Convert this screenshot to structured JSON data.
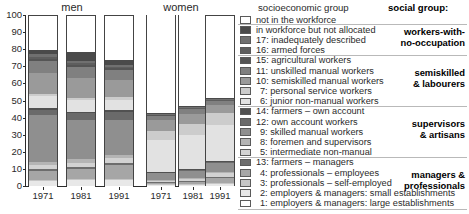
{
  "chart_data": {
    "type": "bar",
    "subtype": "stacked-100-percent",
    "title": "",
    "xlabel": "",
    "ylabel": "",
    "ylim": [
      0,
      100
    ],
    "yticks": [
      0,
      10,
      20,
      30,
      40,
      50,
      60,
      70,
      80,
      90,
      100
    ],
    "grid": false,
    "legend_position": "right",
    "panels": [
      {
        "label": "men",
        "categories": [
          "1971",
          "1981",
          "1991"
        ]
      },
      {
        "label": "women",
        "categories": [
          "1971",
          "1981",
          "1991"
        ]
      }
    ],
    "series": [
      {
        "name": "1: employers & managers: large establishments",
        "code": "1",
        "color": "#ffffff",
        "values": {
          "men": [
            0.8,
            0.8,
            0.8
          ],
          "women": [
            0.3,
            0.3,
            0.4
          ]
        }
      },
      {
        "name": "2: employers & managers: small establishments",
        "code": "2",
        "color": "#e8e8e8",
        "values": {
          "men": [
            2.9,
            3.4,
            3.4
          ],
          "women": [
            1.0,
            1.2,
            1.6
          ]
        }
      },
      {
        "name": "3: professionals – self-employed",
        "code": "3",
        "color": "#c6c6c6",
        "values": {
          "men": [
            0.6,
            0.6,
            0.6
          ],
          "women": [
            0.2,
            0.2,
            0.3
          ]
        }
      },
      {
        "name": "4: professionals – employees",
        "code": "4",
        "color": "#a6a6a6",
        "values": {
          "men": [
            5.2,
            5.7,
            8.2
          ],
          "women": [
            1.0,
            1.4,
            3.4
          ]
        }
      },
      {
        "name": "13: farmers – managers",
        "code": "13",
        "color": "#6d6d6d",
        "values": {
          "men": [
            1.1,
            1.0,
            0.9
          ],
          "women": [
            0.2,
            0.2,
            0.2
          ]
        }
      },
      {
        "name": "5: intermediate non-manual",
        "code": "5",
        "color": "#d2d2d2",
        "values": {
          "men": [
            2.2,
            2.5,
            2.9
          ],
          "women": [
            1.1,
            1.3,
            2.1
          ]
        }
      },
      {
        "name": "8: foremen and supervisors",
        "code": "8",
        "color": "#b4b4b4",
        "values": {
          "men": [
            2.1,
            2.2,
            2.1
          ],
          "women": [
            0.4,
            0.5,
            0.6
          ]
        }
      },
      {
        "name": "9: skilled manual workers",
        "code": "9",
        "color": "#8f8f8f",
        "values": {
          "men": [
            27.0,
            23.0,
            20.0
          ],
          "women": [
            3.7,
            4.3,
            5.2
          ]
        }
      },
      {
        "name": "12: own account workers",
        "code": "12",
        "color": "#6a6a6a",
        "values": {
          "men": [
            3.2,
            3.8,
            5.0
          ],
          "women": [
            0.8,
            0.9,
            1.4
          ]
        }
      },
      {
        "name": "14: farmers – own account",
        "code": "14",
        "color": "#515151",
        "values": {
          "men": [
            1.2,
            1.1,
            0.9
          ],
          "women": [
            0.2,
            0.2,
            0.2
          ]
        }
      },
      {
        "name": "6: junior non-manual workers",
        "code": "6",
        "color": "#e2e2e2",
        "values": {
          "men": [
            6.8,
            6.5,
            6.3
          ],
          "women": [
            18.5,
            20.0,
            21.0
          ]
        }
      },
      {
        "name": "7: personal service workers",
        "code": "7",
        "color": "#cccccc",
        "values": {
          "men": [
            1.3,
            1.4,
            1.7
          ],
          "women": [
            5.5,
            6.2,
            6.8
          ]
        }
      },
      {
        "name": "10: semiskilled manual workers",
        "code": "10",
        "color": "#9a9a9a",
        "values": {
          "men": [
            12.0,
            11.5,
            10.0
          ],
          "women": [
            6.0,
            5.8,
            4.6
          ]
        }
      },
      {
        "name": "11: unskilled manual workers",
        "code": "11",
        "color": "#808080",
        "values": {
          "men": [
            7.0,
            6.5,
            5.5
          ],
          "women": [
            3.0,
            3.1,
            2.6
          ]
        }
      },
      {
        "name": "15: agricultural workers",
        "code": "15",
        "color": "#555555",
        "values": {
          "men": [
            1.6,
            1.3,
            1.1
          ],
          "women": [
            0.4,
            0.4,
            0.3
          ]
        }
      },
      {
        "name": "16: armed forces",
        "code": "16",
        "color": "#5e5e5e",
        "values": {
          "men": [
            1.3,
            1.2,
            1.0
          ],
          "women": [
            0.1,
            0.1,
            0.1
          ]
        }
      },
      {
        "name": "17: inadequately described",
        "code": "17",
        "color": "#707070",
        "values": {
          "men": [
            1.4,
            1.3,
            1.2
          ],
          "women": [
            0.5,
            0.5,
            0.5
          ]
        }
      },
      {
        "name": "in workforce but not allocated",
        "code": "na",
        "color": "#4a4a4a",
        "values": {
          "men": [
            2.3,
            5.2,
            2.4
          ],
          "women": [
            0.6,
            0.9,
            0.9
          ]
        }
      },
      {
        "name": "not in the workforce",
        "code": "niw",
        "color": "#ffffff",
        "values": {
          "men": [
            19.0,
            21.0,
            26.0
          ],
          "women": [
            57.0,
            53.0,
            48.0
          ]
        }
      }
    ]
  },
  "plot": {
    "panel_titles": {
      "men": "men",
      "women": "women"
    },
    "y_axis": {
      "ticks": [
        "100",
        "90",
        "80",
        "70",
        "60",
        "50",
        "40",
        "30",
        "20",
        "10",
        "0"
      ]
    },
    "x_axis": {
      "men_ticks": [
        "1971",
        "1981",
        "1991"
      ],
      "women_ticks": [
        "1971",
        "1981",
        "1991"
      ]
    }
  },
  "legend": {
    "header_socioeconomic": "socioeconomic group",
    "header_social": "social group:",
    "rows": [
      {
        "label": "not in the workforce",
        "color": "#ffffff",
        "indent": false
      },
      {
        "label": "in workforce but not allocated",
        "color": "#4a4a4a",
        "indent": false
      },
      {
        "label": "17: inadequately described",
        "color": "#707070",
        "indent": false
      },
      {
        "label": "16: armed forces",
        "color": "#5e5e5e",
        "indent": false
      },
      {
        "label": "15: agricultural workers",
        "color": "#555555",
        "indent": false
      },
      {
        "label": "11: unskilled manual workers",
        "color": "#808080",
        "indent": false
      },
      {
        "label": "10: semiskilled manual workers",
        "color": "#9a9a9a",
        "indent": false
      },
      {
        "label": "7: personal service workers",
        "color": "#cccccc",
        "indent": true
      },
      {
        "label": "6: junior non-manual workers",
        "color": "#e2e2e2",
        "indent": true
      },
      {
        "label": "14: farmers – own account",
        "color": "#515151",
        "indent": false
      },
      {
        "label": "12: own account workers",
        "color": "#6a6a6a",
        "indent": false
      },
      {
        "label": "9: skilled manual workers",
        "color": "#8f8f8f",
        "indent": true
      },
      {
        "label": "8: foremen and supervisors",
        "color": "#b4b4b4",
        "indent": true
      },
      {
        "label": "5: intermediate non-manual",
        "color": "#d2d2d2",
        "indent": true
      },
      {
        "label": "13: farmers – managers",
        "color": "#6d6d6d",
        "indent": false
      },
      {
        "label": "4: professionals – employees",
        "color": "#a6a6a6",
        "indent": true
      },
      {
        "label": "3: professionals – self-employed",
        "color": "#c6c6c6",
        "indent": true
      },
      {
        "label": "2: employers & managers: small establishments",
        "color": "#e8e8e8",
        "indent": true
      },
      {
        "label": "1: employers & managers: large establishments",
        "color": "#ffffff",
        "indent": true
      }
    ],
    "social_groups": [
      {
        "lines": [
          "workers-with-",
          "no-occupation"
        ]
      },
      {
        "lines": [
          "semiskilled",
          "& labourers"
        ]
      },
      {
        "lines": [
          "supervisors",
          "& artisans"
        ]
      },
      {
        "lines": [
          "managers &",
          "professionals"
        ]
      }
    ]
  }
}
